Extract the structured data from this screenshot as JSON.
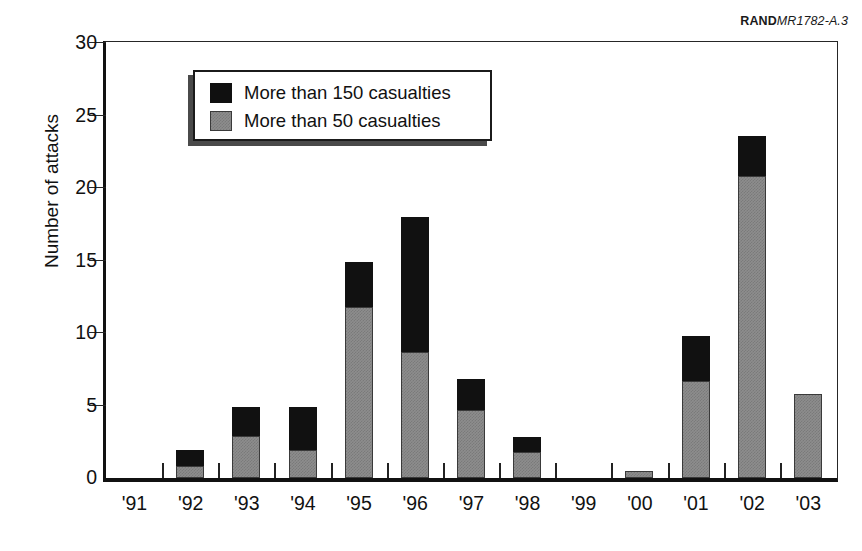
{
  "credit": {
    "brand": "RAND",
    "document": "MR1782-A.3"
  },
  "chart_data": {
    "type": "bar",
    "subtype": "stacked-vertical",
    "title": "",
    "xlabel": "",
    "ylabel": "Number of attacks",
    "categories": [
      "'91",
      "'92",
      "'93",
      "'94",
      "'95",
      "'96",
      "'97",
      "'98",
      "'99",
      "'00",
      "'01",
      "'02",
      "'03"
    ],
    "series": [
      {
        "name": "More than 50 casualties",
        "color": "#8d8d8d",
        "values": [
          0,
          0.8,
          2.9,
          1.9,
          11.8,
          8.7,
          4.7,
          1.8,
          0,
          0.5,
          6.7,
          20.8,
          5.8
        ]
      },
      {
        "name": "More than 150 casualties",
        "color": "#111111",
        "values": [
          0,
          1.1,
          2.0,
          3.0,
          3.1,
          9.3,
          2.1,
          1.0,
          0,
          0,
          3.1,
          2.8,
          0
        ]
      }
    ],
    "totals": [
      0,
      1.9,
      4.9,
      4.9,
      14.9,
      18.0,
      6.8,
      2.8,
      0,
      0.5,
      9.8,
      23.6,
      5.8
    ],
    "ylim": [
      0,
      30
    ],
    "yticks": [
      0,
      5,
      10,
      15,
      20,
      25,
      30
    ],
    "ytick_labels": [
      "0",
      "5",
      "10",
      "15",
      "20",
      "25",
      "30"
    ],
    "grid": false,
    "legend_position": "upper-left-inset",
    "legend_entries": [
      {
        "label": "More than 150 casualties",
        "swatch": "black"
      },
      {
        "label": "More than 50 casualties",
        "swatch": "gray"
      }
    ]
  }
}
